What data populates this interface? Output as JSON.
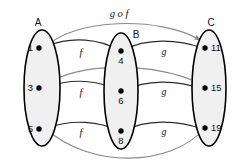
{
  "diagram": {
    "title_label": "g∘f",
    "sets": [
      {
        "name": "A",
        "label": "A",
        "elements": [
          "1",
          "3",
          "5"
        ]
      },
      {
        "name": "B",
        "label": "B",
        "elements": [
          "4",
          "6",
          "8"
        ]
      },
      {
        "name": "C",
        "label": "C",
        "elements": [
          "11",
          "15",
          "19"
        ]
      }
    ],
    "map_labels": {
      "f": "f",
      "g": "g",
      "composition": "g o f"
    },
    "edge_labels": {
      "f1": "f",
      "f2": "f",
      "f3": "f",
      "g1": "g",
      "g2": "g",
      "g3": "g"
    },
    "colors": {
      "ellipse_fill": "#f0f0f0",
      "ellipse_stroke": "#000000",
      "arrow_direct": "#2b2b2b",
      "arrow_composite": "#8a8a8a",
      "dot": "#000000",
      "text": "#111111",
      "background": "#ffffff"
    },
    "mappings": {
      "f": [
        {
          "from": "1",
          "to": "4"
        },
        {
          "from": "3",
          "to": "6"
        },
        {
          "from": "5",
          "to": "8"
        }
      ],
      "g": [
        {
          "from": "4",
          "to": "11"
        },
        {
          "from": "6",
          "to": "15"
        },
        {
          "from": "8",
          "to": "19"
        }
      ],
      "composition": [
        {
          "from": "1",
          "to": "11"
        },
        {
          "from": "3",
          "to": "15"
        },
        {
          "from": "5",
          "to": "19"
        }
      ]
    }
  }
}
